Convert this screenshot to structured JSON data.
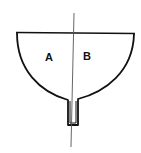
{
  "diagram": {
    "type": "funnel-cross-section",
    "labels": {
      "left": "A",
      "right": "B"
    },
    "colors": {
      "stroke": "#111111",
      "axis": "#555555",
      "background": "#ffffff"
    }
  }
}
